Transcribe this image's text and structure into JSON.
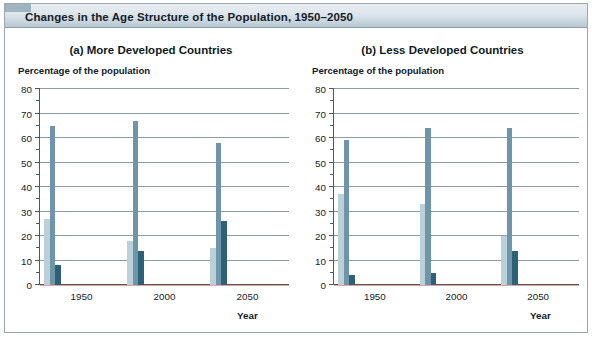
{
  "header": {
    "title": "Changes in the Age Structure of the Population, 1950–2050"
  },
  "colors": {
    "light_bar": "#bcd0da",
    "medium_bar": "#6f96a8",
    "dark_bar": "#2d6177",
    "axis": "#4b5a63",
    "gridline": "#8e9ba3",
    "title_band": "#c6d3db"
  },
  "panels": [
    {
      "id": "a",
      "title": "(a) More Developed Countries",
      "y_axis_title": "Percentage of the population",
      "x_axis_title": "Year"
    },
    {
      "id": "b",
      "title": "(b) Less Developed Countries",
      "y_axis_title": "Percentage of the population",
      "x_axis_title": "Year"
    }
  ],
  "axis": {
    "y_ticks": [
      "80",
      "70",
      "60",
      "50",
      "40",
      "30",
      "20",
      "10",
      "0"
    ],
    "y_minor_ticks": [
      "75",
      "65",
      "55",
      "45",
      "35",
      "25",
      "15",
      "5"
    ]
  },
  "chart_data": [
    {
      "type": "bar",
      "title": "(a) More Developed Countries",
      "xlabel": "Year",
      "ylabel": "Percentage of the population",
      "ylim": [
        0,
        80
      ],
      "ytick_step": 10,
      "grid": true,
      "legend": null,
      "categories": [
        "1950",
        "2000",
        "2050"
      ],
      "series": [
        {
          "name": "light",
          "color": "#bcd0da",
          "values": [
            27,
            18,
            15
          ]
        },
        {
          "name": "medium",
          "color": "#6f96a8",
          "values": [
            65,
            67,
            58
          ]
        },
        {
          "name": "dark",
          "color": "#2d6177",
          "values": [
            8,
            14,
            26
          ]
        }
      ]
    },
    {
      "type": "bar",
      "title": "(b) Less Developed Countries",
      "xlabel": "Year",
      "ylabel": "Percentage of the population",
      "ylim": [
        0,
        80
      ],
      "ytick_step": 10,
      "grid": true,
      "legend": null,
      "categories": [
        "1950",
        "2000",
        "2050"
      ],
      "series": [
        {
          "name": "light",
          "color": "#bcd0da",
          "values": [
            37,
            33,
            20
          ]
        },
        {
          "name": "medium",
          "color": "#6f96a8",
          "values": [
            59,
            64,
            64
          ]
        },
        {
          "name": "dark",
          "color": "#2d6177",
          "values": [
            4,
            5,
            14
          ]
        }
      ]
    }
  ]
}
